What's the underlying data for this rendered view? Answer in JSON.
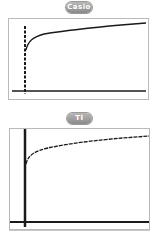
{
  "panels": [
    {
      "label": "Casio",
      "description": "Graph of a logarithmic-like increasing curve on a Casio calculator screen with dashed y-axis",
      "axis_style": "dashed",
      "curve_style": "solid"
    },
    {
      "label": "TI",
      "description": "Graph of a logarithmic-like increasing curve on a TI calculator screen with solid thick y-axis",
      "axis_style": "solid",
      "curve_style": "dashed-pixelated"
    }
  ],
  "colors": {
    "badge": "#9a9a9a",
    "frame": "#b9b9b9",
    "line": "#1a1a1a"
  }
}
